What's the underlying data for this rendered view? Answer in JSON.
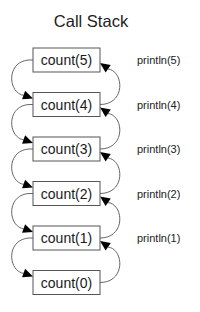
{
  "diagram": {
    "title": "Call Stack",
    "frames": [
      {
        "label": "count(5)",
        "note": "println(5)"
      },
      {
        "label": "count(4)",
        "note": "println(4)"
      },
      {
        "label": "count(3)",
        "note": "println(3)"
      },
      {
        "label": "count(2)",
        "note": "println(2)"
      },
      {
        "label": "count(1)",
        "note": "println(1)"
      },
      {
        "label": "count(0)",
        "note": ""
      }
    ],
    "edges": {
      "calls": [
        {
          "from": "count(5)",
          "to": "count(4)"
        },
        {
          "from": "count(4)",
          "to": "count(3)"
        },
        {
          "from": "count(3)",
          "to": "count(2)"
        },
        {
          "from": "count(2)",
          "to": "count(1)"
        },
        {
          "from": "count(1)",
          "to": "count(0)"
        }
      ],
      "returns": [
        {
          "from": "count(4)",
          "to": "count(5)"
        },
        {
          "from": "count(3)",
          "to": "count(4)"
        },
        {
          "from": "count(2)",
          "to": "count(3)"
        },
        {
          "from": "count(1)",
          "to": "count(2)"
        },
        {
          "from": "count(0)",
          "to": "count(1)"
        }
      ]
    }
  }
}
